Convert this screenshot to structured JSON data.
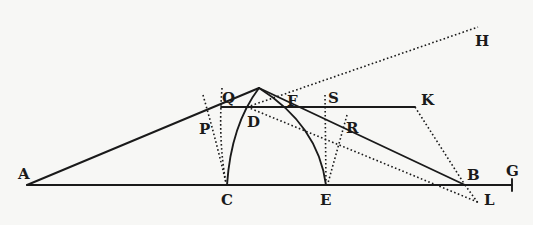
{
  "figure": {
    "type": "geometric-construction",
    "labels": {
      "A": "A",
      "B": "B",
      "C": "C",
      "D": "D",
      "E": "E",
      "F": "F",
      "G": "G",
      "H": "H",
      "K": "K",
      "L": "L",
      "P": "P",
      "Q": "Q",
      "R": "R",
      "S": "S"
    },
    "points": {
      "A": [
        27,
        185
      ],
      "B": [
        465,
        185
      ],
      "C": [
        227,
        185
      ],
      "E": [
        326,
        185
      ],
      "G": [
        512,
        185
      ],
      "D": [
        247,
        107
      ],
      "F": [
        287,
        107
      ],
      "apex": [
        259,
        88
      ],
      "Q": [
        221,
        107
      ],
      "K": [
        415,
        107
      ],
      "H": [
        478,
        27
      ],
      "L": [
        480,
        203
      ]
    },
    "colors": {
      "ink": "#1a1a1a",
      "paper": "#f7f7f5"
    }
  }
}
